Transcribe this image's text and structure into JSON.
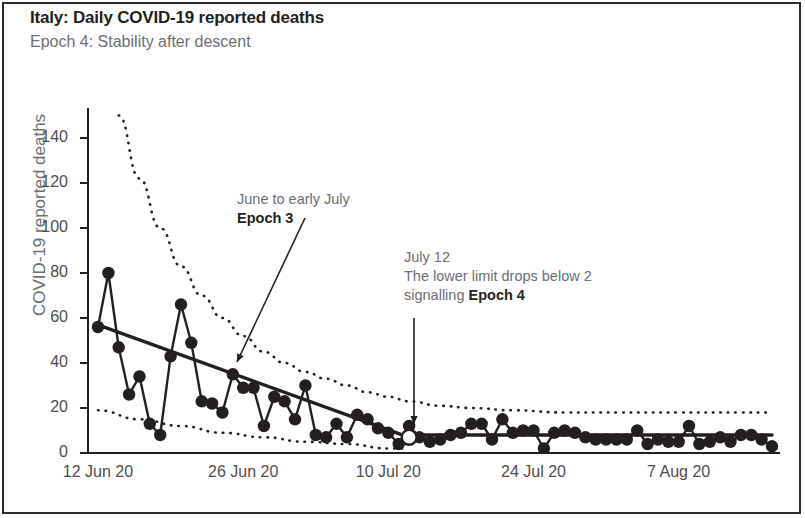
{
  "chart_data": {
    "type": "line",
    "title": "Italy: Daily COVID-19 reported deaths",
    "subtitle": "Epoch 4: Stability after descent",
    "xlabel": "",
    "ylabel": "COVID-19 reported deaths",
    "ylim": [
      0,
      150
    ],
    "yticks": [
      0,
      20,
      40,
      60,
      80,
      100,
      120,
      140
    ],
    "ytick_labels": [
      "0",
      "20",
      "40",
      "60",
      "80",
      "100",
      "120",
      "140"
    ],
    "xlim": [
      "12 Jun 20",
      "16 Aug 20"
    ],
    "xticks": [
      0,
      14,
      28,
      42,
      56
    ],
    "xtick_labels": [
      "12 Jun 20",
      "26 Jun 20",
      "10 Jul 20",
      "24 Jul 20",
      "7 Aug 20"
    ],
    "grid": false,
    "legend": "none",
    "series": [
      {
        "name": "Daily reported deaths",
        "type": "scatter-line",
        "marker": "filled-circle",
        "color": "#231f20",
        "x": [
          0,
          1,
          2,
          3,
          4,
          5,
          6,
          7,
          8,
          9,
          10,
          11,
          12,
          13,
          14,
          15,
          16,
          17,
          18,
          19,
          20,
          21,
          22,
          23,
          24,
          25,
          26,
          27,
          28,
          29,
          30,
          31,
          32,
          33,
          34,
          35,
          36,
          37,
          38,
          39,
          40,
          41,
          42,
          43,
          44,
          45,
          46,
          47,
          48,
          49,
          50,
          51,
          52,
          53,
          54,
          55,
          56,
          57,
          58,
          59,
          60,
          61,
          62,
          63,
          64,
          65
        ],
        "values": [
          56,
          80,
          47,
          26,
          34,
          13,
          8,
          43,
          66,
          49,
          23,
          22,
          18,
          35,
          29,
          29,
          12,
          25,
          23,
          15,
          30,
          8,
          7,
          13,
          7,
          17,
          15,
          11,
          9,
          4,
          12,
          7,
          5,
          6,
          8,
          9,
          13,
          13,
          6,
          15,
          9,
          10,
          10,
          2,
          9,
          10,
          9,
          7,
          6,
          6,
          6,
          6,
          10,
          4,
          6,
          5,
          5,
          12,
          4,
          5,
          7,
          5,
          8,
          8,
          6,
          3
        ]
      },
      {
        "name": "Epoch 3 trend (fitted mean)",
        "type": "line",
        "color": "#231f20",
        "x": [
          0,
          30
        ],
        "values": [
          57,
          7
        ]
      },
      {
        "name": "Epoch 4 trend (fitted mean)",
        "type": "line",
        "color": "#231f20",
        "x": [
          30,
          65
        ],
        "values": [
          8,
          8
        ]
      },
      {
        "name": "Upper control limit",
        "type": "dotted",
        "color": "#231f20",
        "x": [
          2,
          4,
          6,
          8,
          10,
          12,
          14,
          16,
          18,
          20,
          22,
          24,
          26,
          28,
          30,
          33,
          36,
          40,
          45,
          50,
          56,
          62,
          65
        ],
        "values": [
          150,
          122,
          100,
          83,
          70,
          60,
          52,
          45,
          40,
          36,
          33,
          30,
          27,
          25,
          23,
          21,
          20,
          19,
          18,
          18,
          18,
          18,
          18
        ]
      },
      {
        "name": "Lower control limit",
        "type": "dotted",
        "color": "#231f20",
        "x": [
          0,
          4,
          8,
          12,
          16,
          20,
          24,
          28,
          30
        ],
        "values": [
          19,
          15,
          12,
          9,
          7,
          5,
          4,
          2,
          2
        ]
      }
    ],
    "markers": [
      {
        "name": "epoch-4-transition-point",
        "style": "open-circle",
        "x": 30,
        "value": 7,
        "label": "July 12"
      }
    ],
    "annotations": [
      {
        "name": "epoch-3-annotation",
        "line1": "June to early July",
        "line2": "Epoch 3",
        "arrow_from": [
          305,
          218
        ],
        "arrow_to": [
          237,
          362
        ]
      },
      {
        "name": "epoch-4-annotation",
        "line1": "July 12",
        "line2": "The lower limit drops below 2",
        "line3_prefix": "signalling ",
        "line3_bold": "Epoch 4",
        "arrow_from": [
          414,
          318
        ],
        "arrow_to": [
          414,
          424
        ]
      }
    ]
  },
  "axes": {
    "y_title": "COVID-19 reported deaths",
    "y_tick_labels": [
      "140",
      "120",
      "100",
      "80",
      "60",
      "40",
      "20",
      "0"
    ],
    "x_tick_labels": [
      "12 Jun 20",
      "26 Jun 20",
      "10 Jul 20",
      "24 Jul 20",
      "7 Aug 20"
    ]
  },
  "header": {
    "title": "Italy: Daily COVID-19 reported deaths",
    "subtitle": "Epoch 4: Stability after descent"
  },
  "annotation_a": {
    "line1": "June to early July",
    "line2": "Epoch 3"
  },
  "annotation_b": {
    "line1": "July 12",
    "line2": "The lower limit drops below 2",
    "line3_prefix": "signalling ",
    "line3_bold": "Epoch 4"
  },
  "colors": {
    "ink": "#231f20",
    "muted": "#6d6e71",
    "background": "#ffffff"
  }
}
